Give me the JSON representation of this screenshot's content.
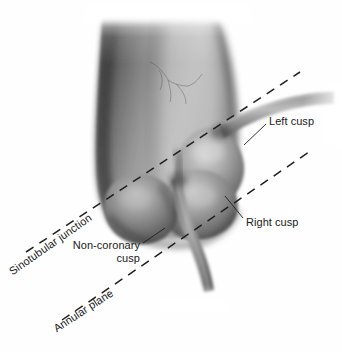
{
  "figure": {
    "name": "aortic-root-anatomy-illustration",
    "style": "grayscale-medical-illustration",
    "width": 342,
    "height": 352,
    "background_color": "#fefefe",
    "ink_color": "#1a1a1a"
  },
  "labels": {
    "left_cusp": "Left cusp",
    "right_cusp": "Right cusp",
    "non_coronary_cusp_line1": "Non-coronary",
    "non_coronary_cusp_line2": "cusp",
    "sinotubular_junction": "Sinotubular junction",
    "annular_plane": "Annular plane"
  },
  "anatomy": {
    "ascending_aorta": "ascending-aorta",
    "sinus_of_valsalva_left": "left-coronary-sinus",
    "sinus_of_valsalva_right": "right-coronary-sinus",
    "sinus_of_valsalva_noncoronary": "non-coronary-sinus",
    "left_coronary_artery": "left-coronary-artery",
    "right_coronary_artery": "right-coronary-artery"
  },
  "reference_lines": {
    "sinotubular_junction": {
      "style": "dashed",
      "x1": 26,
      "y1": 252,
      "x2": 300,
      "y2": 72
    },
    "annular_plane": {
      "style": "dashed",
      "x1": 62,
      "y1": 320,
      "x2": 312,
      "y2": 150
    }
  },
  "shading": {
    "highlight": "#f2f2f2",
    "midtone": "#9b9b9b",
    "shadow": "#4a4a4a",
    "deep_shadow": "#2e2e2e"
  }
}
